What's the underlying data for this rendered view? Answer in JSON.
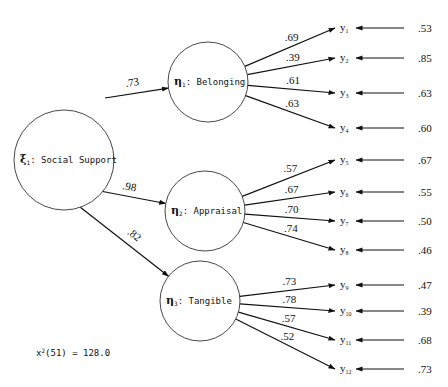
{
  "diagram": {
    "exogenous": {
      "symbol": "ξ",
      "sub": "1",
      "label": ": Social Support"
    },
    "factors": [
      {
        "symbol": "η",
        "sub": "1",
        "label": ": Belonging",
        "path_coef": ".73"
      },
      {
        "symbol": "η",
        "sub": "2",
        "label": ": Appraisal",
        "path_coef": ".98"
      },
      {
        "symbol": "η",
        "sub": "3",
        "label": ": Tangible",
        "path_coef": ".82"
      }
    ],
    "indicators": [
      {
        "name": "y",
        "sub": "1",
        "loading": ".69",
        "error": ".53",
        "factor": 0
      },
      {
        "name": "y",
        "sub": "2",
        "loading": ".39",
        "error": ".85",
        "factor": 0
      },
      {
        "name": "y",
        "sub": "3",
        "loading": ".61",
        "error": ".63",
        "factor": 0
      },
      {
        "name": "y",
        "sub": "4",
        "loading": ".63",
        "error": ".60",
        "factor": 0
      },
      {
        "name": "y",
        "sub": "5",
        "loading": ".57",
        "error": ".67",
        "factor": 1
      },
      {
        "name": "y",
        "sub": "6",
        "loading": ".67",
        "error": ".55",
        "factor": 1
      },
      {
        "name": "y",
        "sub": "7",
        "loading": ".70",
        "error": ".50",
        "factor": 1
      },
      {
        "name": "y",
        "sub": "8",
        "loading": ".74",
        "error": ".46",
        "factor": 1
      },
      {
        "name": "y",
        "sub": "9",
        "loading": ".73",
        "error": ".47",
        "factor": 2
      },
      {
        "name": "y",
        "sub": "10",
        "loading": ".78",
        "error": ".39",
        "factor": 2
      },
      {
        "name": "y",
        "sub": "11",
        "loading": ".57",
        "error": ".68",
        "factor": 2
      },
      {
        "name": "y",
        "sub": "12",
        "loading": ".52",
        "error": ".73",
        "factor": 2
      }
    ],
    "fit": {
      "stat": "x",
      "sup": "2",
      "df": "(51)",
      "value": " = 128.0"
    }
  }
}
